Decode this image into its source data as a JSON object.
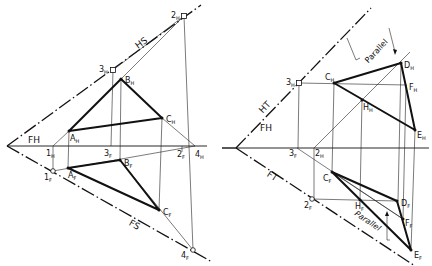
{
  "figure": {
    "left": {
      "lines": {
        "fh": "FH",
        "hs": "HS",
        "fs": "FS"
      },
      "points": {
        "2H": {
          "main": "2",
          "sub": "H"
        },
        "3H": {
          "main": "3",
          "sub": "H"
        },
        "BH": {
          "main": "B",
          "sub": "H"
        },
        "CH": {
          "main": "C",
          "sub": "H"
        },
        "AH": {
          "main": "A",
          "sub": "H"
        },
        "1H": {
          "main": "1",
          "sub": "H"
        },
        "3F": {
          "main": "3",
          "sub": "F"
        },
        "2F": {
          "main": "2",
          "sub": "F"
        },
        "4H": {
          "main": "4",
          "sub": "H"
        },
        "1F": {
          "main": "1",
          "sub": "F"
        },
        "AF": {
          "main": "A",
          "sub": "F"
        },
        "BF": {
          "main": "B",
          "sub": "F"
        },
        "CF": {
          "main": "C",
          "sub": "F"
        },
        "4F": {
          "main": "4",
          "sub": "F"
        }
      }
    },
    "right": {
      "lines": {
        "fh": "FH",
        "ht": "HT",
        "ft": "FT"
      },
      "annotations": {
        "parallel_top": "Parallel",
        "parallel_bottom": "Parallel"
      },
      "points": {
        "3H": {
          "main": "3",
          "sub": "H"
        },
        "CH": {
          "main": "C",
          "sub": "H"
        },
        "DH": {
          "main": "D",
          "sub": "H"
        },
        "FH": {
          "main": "F",
          "sub": "H"
        },
        "HH": {
          "main": "H",
          "sub": "H"
        },
        "EH": {
          "main": "E",
          "sub": "H"
        },
        "3F": {
          "main": "3",
          "sub": "F"
        },
        "2H": {
          "main": "2",
          "sub": "H"
        },
        "CF": {
          "main": "C",
          "sub": "F"
        },
        "2F": {
          "main": "2",
          "sub": "F"
        },
        "HF": {
          "main": "H",
          "sub": "F"
        },
        "DF": {
          "main": "D",
          "sub": "F"
        },
        "FF": {
          "main": "F",
          "sub": "F"
        },
        "EF": {
          "main": "E",
          "sub": "F"
        }
      }
    }
  }
}
